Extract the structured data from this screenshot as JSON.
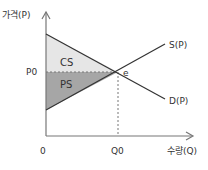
{
  "diagram": {
    "y_axis_label": "가격(P)",
    "x_axis_label": "수량(Q)",
    "origin_label": "0",
    "price_label": "P0",
    "quantity_label": "Q0",
    "equilibrium_label": "e",
    "supply_label": "S(P)",
    "demand_label": "D(P)",
    "cs_label": "CS",
    "ps_label": "PS",
    "colors": {
      "axis": "#777777",
      "curve": "#333333",
      "cs_fill": "#e6e6e6",
      "ps_fill": "#a6a6a6",
      "dashed": "#777777"
    }
  }
}
